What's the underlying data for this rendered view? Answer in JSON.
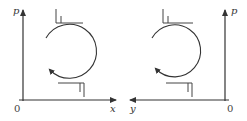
{
  "diagram": {
    "stroke_color": "#333333",
    "panels": [
      {
        "id": "left",
        "axes": {
          "vertical_label": "p",
          "horizontal_label": "x",
          "origin_label": "0",
          "horizontal_arrow_direction": "right"
        },
        "cycle_direction": "clockwise",
        "glyphs": [
          "top-bracket-symbol",
          "bottom-bracket-symbol"
        ]
      },
      {
        "id": "right",
        "axes": {
          "vertical_label": "p",
          "horizontal_label": "y",
          "origin_label": "0",
          "horizontal_arrow_direction": "left"
        },
        "cycle_direction": "clockwise",
        "glyphs": [
          "top-bracket-symbol",
          "bottom-bracket-symbol"
        ]
      }
    ]
  }
}
